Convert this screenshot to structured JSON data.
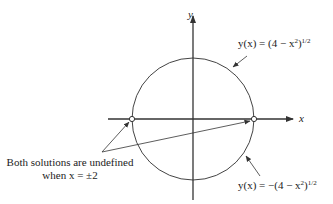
{
  "axes": {
    "x_label": "x",
    "y_label": "y"
  },
  "curves": {
    "upper": {
      "lhs": "y(x) = (4 − x",
      "exp2": "2",
      "close": ")",
      "exp": "1/2"
    },
    "lower": {
      "lhs": "y(x) = −(4 − x",
      "exp2": "2",
      "close": ")",
      "exp": "1/2"
    }
  },
  "annotation": {
    "line1": "Both solutions are undefined",
    "line2": "when x = ±2"
  },
  "colors": {
    "stroke": "#333333",
    "background": "#ffffff"
  }
}
